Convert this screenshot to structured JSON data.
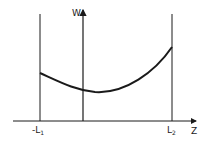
{
  "diagram": {
    "axis_y_label": "W",
    "axis_x_label": "Z",
    "left_bound": {
      "prefix": "-L",
      "sub": "1"
    },
    "right_bound": {
      "prefix": "L",
      "sub": "2"
    }
  },
  "colors": {
    "stroke": "#1a1a1a",
    "background": "#ffffff"
  }
}
